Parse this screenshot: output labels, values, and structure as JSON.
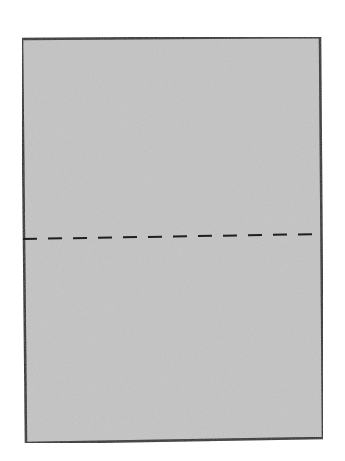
{
  "diagram": {
    "type": "folded-sheet",
    "sheet": {
      "fill_color": "#c4c4c4",
      "border_color": "#2a2a2a",
      "border_width": 2.5,
      "corners": {
        "top_left": [
          22,
          39
        ],
        "top_right": [
          320,
          37
        ],
        "bottom_right": [
          323,
          438
        ],
        "bottom_left": [
          26,
          443
        ]
      }
    },
    "fold_line": {
      "style": "dashed",
      "color": "#1e1e1e",
      "stroke_width": 2,
      "dash_length": 14,
      "gap_length": 11,
      "start": [
        23,
        239
      ],
      "end": [
        321,
        234
      ]
    }
  }
}
